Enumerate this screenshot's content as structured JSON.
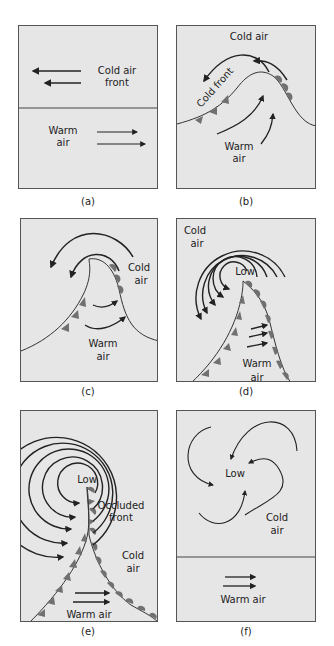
{
  "figure": {
    "colors": {
      "panel_bg": "#e6e6e6",
      "panel_border": "#555555",
      "line": "#222222",
      "front_symbol": "#707070"
    },
    "panels": [
      {
        "id": "a",
        "caption": "(a)",
        "labels": {
          "cold": "Cold air",
          "cold2": "front",
          "warm": "Warm",
          "warm2": "air"
        }
      },
      {
        "id": "b",
        "caption": "(b)",
        "labels": {
          "cold": "Cold air",
          "front": "Cold front",
          "warm": "Warm",
          "warm2": "air"
        }
      },
      {
        "id": "c",
        "caption": "(c)",
        "labels": {
          "cold": "Cold",
          "cold2": "air",
          "warm": "Warm",
          "warm2": "air"
        }
      },
      {
        "id": "d",
        "caption": "(d)",
        "labels": {
          "cold": "Cold",
          "cold2": "air",
          "low": "Low",
          "warm": "Warm",
          "warm2": "air"
        }
      },
      {
        "id": "e",
        "caption": "(e)",
        "labels": {
          "low": "Low",
          "occluded": "Occluded",
          "occluded2": "front",
          "cold": "Cold",
          "cold2": "air",
          "warm": "Warm air"
        }
      },
      {
        "id": "f",
        "caption": "(f)",
        "labels": {
          "low": "Low",
          "cold": "Cold",
          "cold2": "air",
          "warm": "Warm air"
        }
      }
    ]
  }
}
